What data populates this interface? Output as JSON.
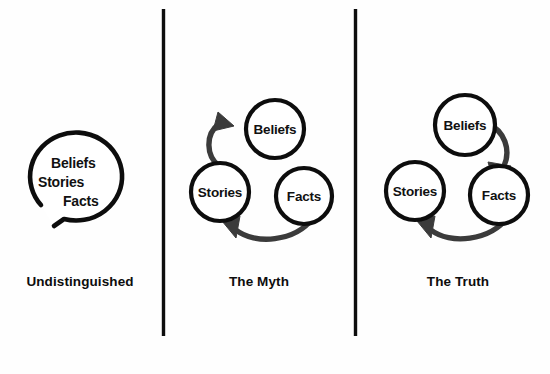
{
  "figure": {
    "background_color": "#fefefe",
    "ink_color": "#0d0d0d",
    "arrow_color": "#3b3b3b",
    "panel_count": 3
  },
  "panels": [
    {
      "id": "undistinguished",
      "caption": "Undistinguished",
      "kind": "single-blob",
      "nodes": [
        {
          "id": "beliefs",
          "label": "Beliefs"
        },
        {
          "id": "stories",
          "label": "Stories"
        },
        {
          "id": "facts",
          "label": "Facts"
        }
      ],
      "arrows": []
    },
    {
      "id": "the-myth",
      "caption": "The Myth",
      "kind": "three-circles",
      "nodes": [
        {
          "id": "beliefs",
          "label": "Beliefs"
        },
        {
          "id": "stories",
          "label": "Stories"
        },
        {
          "id": "facts",
          "label": "Facts"
        }
      ],
      "arrows": [
        {
          "from": "stories",
          "to": "beliefs"
        },
        {
          "from": "facts",
          "to": "stories"
        }
      ]
    },
    {
      "id": "the-truth",
      "caption": "The Truth",
      "kind": "three-circles",
      "nodes": [
        {
          "id": "beliefs",
          "label": "Beliefs"
        },
        {
          "id": "stories",
          "label": "Stories"
        },
        {
          "id": "facts",
          "label": "Facts"
        }
      ],
      "arrows": [
        {
          "from": "beliefs",
          "to": "facts"
        },
        {
          "from": "facts",
          "to": "stories"
        }
      ]
    }
  ]
}
